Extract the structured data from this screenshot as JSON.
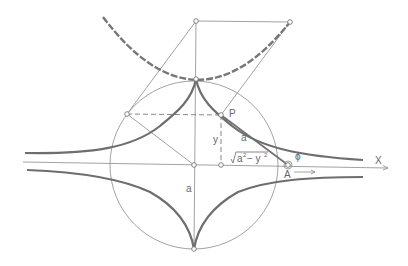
{
  "figure": {
    "labels": {
      "point_p": "P",
      "point_a": "A",
      "axis_x": "X",
      "segment_y": "y",
      "segment_a_tangent": "a",
      "segment_a_radius": "a",
      "sqrt_expr": "a² − y²",
      "sqrt_base": "a",
      "sqrt_minus": " − y",
      "exp_2": "2",
      "angle_phi": "ϕ"
    }
  }
}
